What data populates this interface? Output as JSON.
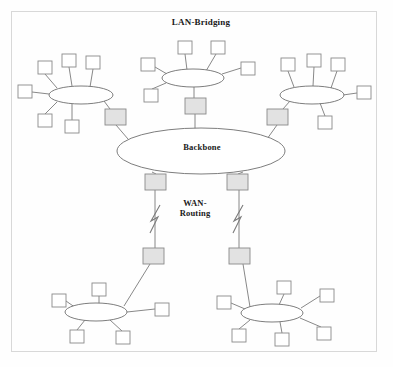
{
  "diagram": {
    "title": "LAN-Bridging",
    "labels": {
      "lan_bridging": "LAN-Bridging",
      "backbone": "Backbone",
      "wan_routing": "WAN-\nRouting"
    },
    "colors": {
      "page_background": "#fefefe",
      "frame_border": "#d8d8d8",
      "node_fill": "#ffffff",
      "node_stroke": "#8a8a8a",
      "bridge_fill": "#e2e2e2",
      "bridge_stroke": "#8a8a8a",
      "ellipse_stroke": "#6e6e6e",
      "link_stroke": "#7a7a7a",
      "text": "#1a1a1a"
    },
    "segments": [
      {
        "name": "lan-cluster-top-left",
        "ellipse": {
          "cx": 81,
          "cy": 95,
          "rx": 32,
          "ry": 9
        },
        "nodes": [
          {
            "name": "host",
            "x": 38,
            "y": 61,
            "w": 14,
            "h": 13
          },
          {
            "name": "host",
            "x": 62,
            "y": 54,
            "w": 14,
            "h": 13
          },
          {
            "name": "host",
            "x": 86,
            "y": 56,
            "w": 14,
            "h": 13
          },
          {
            "name": "host",
            "x": 18,
            "y": 85,
            "w": 14,
            "h": 13
          },
          {
            "name": "host",
            "x": 38,
            "y": 114,
            "w": 14,
            "h": 13
          },
          {
            "name": "host",
            "x": 65,
            "y": 120,
            "w": 14,
            "h": 13
          }
        ],
        "bridge": {
          "name": "bridge",
          "x": 105,
          "y": 109,
          "w": 21,
          "h": 16
        }
      },
      {
        "name": "lan-cluster-top-middle",
        "ellipse": {
          "cx": 193,
          "cy": 78,
          "rx": 31,
          "ry": 9
        },
        "nodes": [
          {
            "name": "host",
            "x": 178,
            "y": 41,
            "w": 14,
            "h": 13
          },
          {
            "name": "host",
            "x": 211,
            "y": 41,
            "w": 14,
            "h": 13
          },
          {
            "name": "host",
            "x": 141,
            "y": 58,
            "w": 14,
            "h": 13
          },
          {
            "name": "host",
            "x": 241,
            "y": 62,
            "w": 14,
            "h": 13
          },
          {
            "name": "host",
            "x": 144,
            "y": 89,
            "w": 14,
            "h": 13
          }
        ],
        "bridge": {
          "name": "bridge",
          "x": 185,
          "y": 98,
          "w": 21,
          "h": 16
        }
      },
      {
        "name": "lan-cluster-top-right",
        "ellipse": {
          "cx": 312,
          "cy": 95,
          "rx": 32,
          "ry": 9
        },
        "nodes": [
          {
            "name": "host",
            "x": 281,
            "y": 58,
            "w": 14,
            "h": 13
          },
          {
            "name": "host",
            "x": 307,
            "y": 54,
            "w": 14,
            "h": 13
          },
          {
            "name": "host",
            "x": 331,
            "y": 58,
            "w": 14,
            "h": 13
          },
          {
            "name": "host",
            "x": 357,
            "y": 86,
            "w": 14,
            "h": 13
          },
          {
            "name": "host",
            "x": 318,
            "y": 116,
            "w": 14,
            "h": 13
          }
        ],
        "bridge": {
          "name": "bridge",
          "x": 267,
          "y": 109,
          "w": 21,
          "h": 16
        }
      },
      {
        "name": "lan-cluster-bottom-left",
        "ellipse": {
          "cx": 96,
          "cy": 312,
          "rx": 31,
          "ry": 9
        },
        "nodes": [
          {
            "name": "host",
            "x": 92,
            "y": 283,
            "w": 14,
            "h": 13
          },
          {
            "name": "host",
            "x": 52,
            "y": 294,
            "w": 14,
            "h": 13
          },
          {
            "name": "host",
            "x": 155,
            "y": 303,
            "w": 14,
            "h": 13
          },
          {
            "name": "host",
            "x": 70,
            "y": 330,
            "w": 14,
            "h": 13
          },
          {
            "name": "host",
            "x": 116,
            "y": 331,
            "w": 14,
            "h": 13
          }
        ],
        "router": {
          "name": "router",
          "x": 143,
          "y": 248,
          "w": 21,
          "h": 16
        }
      },
      {
        "name": "lan-cluster-bottom-right",
        "ellipse": {
          "cx": 272,
          "cy": 313,
          "rx": 31,
          "ry": 9
        },
        "nodes": [
          {
            "name": "host",
            "x": 277,
            "y": 281,
            "w": 14,
            "h": 13
          },
          {
            "name": "host",
            "x": 320,
            "y": 289,
            "w": 14,
            "h": 13
          },
          {
            "name": "host",
            "x": 217,
            "y": 296,
            "w": 14,
            "h": 13
          },
          {
            "name": "host",
            "x": 232,
            "y": 329,
            "w": 14,
            "h": 13
          },
          {
            "name": "host",
            "x": 275,
            "y": 333,
            "w": 14,
            "h": 13
          },
          {
            "name": "host",
            "x": 317,
            "y": 327,
            "w": 14,
            "h": 13
          }
        ],
        "router": {
          "name": "router",
          "x": 229,
          "y": 248,
          "w": 21,
          "h": 16
        }
      }
    ],
    "backbone": {
      "name": "backbone-ellipse",
      "ellipse": {
        "cx": 201,
        "cy": 151,
        "rx": 84,
        "ry": 23
      },
      "routers": [
        {
          "name": "router",
          "x": 145,
          "y": 174,
          "w": 21,
          "h": 16
        },
        {
          "name": "router",
          "x": 227,
          "y": 174,
          "w": 21,
          "h": 16
        }
      ]
    },
    "wan_links": [
      {
        "name": "wan-link-left",
        "x": 155,
        "y_top": 190,
        "y_bottom": 248
      },
      {
        "name": "wan-link-right",
        "x": 238,
        "y_top": 190,
        "y_bottom": 248
      }
    ]
  }
}
